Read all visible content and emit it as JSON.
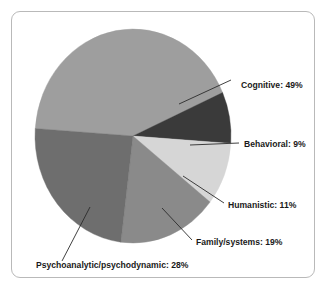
{
  "figure": {
    "caption": "",
    "background_color": "#ffffff",
    "frame_border_color": "#b9b9b9"
  },
  "chart_data": {
    "type": "pie",
    "title": "",
    "xlabel": "",
    "ylabel": "",
    "legend_position": "none",
    "grid": false,
    "labels_format": "{name}: {value}%",
    "start_angle_deg": 184,
    "direction": "clockwise",
    "center": {
      "x": 133,
      "y": 136
    },
    "radius": {
      "x": 98,
      "y": 107
    },
    "categories": [
      "Cognitive",
      "Behavioral",
      "Humanistic",
      "Family/systems",
      "Psychoanalytic/psychodynamic"
    ],
    "values": [
      49,
      9,
      11,
      19,
      28
    ],
    "unit": "%",
    "total": 116,
    "colors": [
      "#9e9e9e",
      "#3a3a3a",
      "#d6d6d6",
      "#8a8a8a",
      "#6e6e6e"
    ],
    "slices": [
      {
        "name": "Cognitive",
        "value": 49,
        "label": "Cognitive: 49%",
        "color": "#9e9e9e",
        "label_x": 241,
        "label_y": 88,
        "leader": [
          [
            179,
            104
          ],
          [
            231,
            80
          ]
        ]
      },
      {
        "name": "Behavioral",
        "value": 9,
        "label": "Behavioral: 9%",
        "color": "#3a3a3a",
        "label_x": 244,
        "label_y": 147,
        "leader": [
          [
            190,
            145
          ],
          [
            239,
            143
          ]
        ]
      },
      {
        "name": "Humanistic",
        "value": 11,
        "label": "Humanistic: 11%",
        "color": "#d6d6d6",
        "label_x": 228,
        "label_y": 208,
        "leader": [
          [
            183,
            176
          ],
          [
            224,
            203
          ]
        ]
      },
      {
        "name": "Family/systems",
        "value": 19,
        "label": "Family/systems: 19%",
        "color": "#8a8a8a",
        "label_x": 196,
        "label_y": 245,
        "leader": [
          [
            162,
            208
          ],
          [
            192,
            240
          ]
        ]
      },
      {
        "name": "Psychoanalytic/psychodynamic",
        "value": 28,
        "label": "Psychoanalytic/psychodynamic: 28%",
        "color": "#6e6e6e",
        "label_x": 36,
        "label_y": 268,
        "leader": [
          [
            90,
            207
          ],
          [
            62,
            261
          ]
        ]
      }
    ]
  }
}
